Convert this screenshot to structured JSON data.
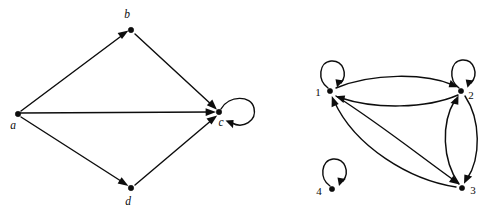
{
  "figure": {
    "background_color": "#ffffff",
    "ink_color": "#0d0d0d"
  },
  "graphs": [
    {
      "id": "left-graph",
      "name": "lettered-digraph",
      "nodes": [
        {
          "id": "a",
          "label": "a",
          "x": 18,
          "y": 114,
          "label_x": 13,
          "label_y": 129,
          "label_style": "italic"
        },
        {
          "id": "b",
          "label": "b",
          "x": 131,
          "y": 30,
          "label_x": 127,
          "label_y": 18,
          "label_style": "italic"
        },
        {
          "id": "c",
          "label": "c",
          "x": 219,
          "y": 112,
          "label_x": 221,
          "label_y": 126,
          "label_style": "italic"
        },
        {
          "id": "d",
          "label": "d",
          "x": 131,
          "y": 188,
          "label_x": 128,
          "label_y": 205,
          "label_style": "italic"
        }
      ],
      "edges": [
        {
          "from": "a",
          "to": "b",
          "kind": "straight"
        },
        {
          "from": "b",
          "to": "c",
          "kind": "straight"
        },
        {
          "from": "a",
          "to": "c",
          "kind": "straight"
        },
        {
          "from": "a",
          "to": "d",
          "kind": "straight"
        },
        {
          "from": "d",
          "to": "c",
          "kind": "straight"
        },
        {
          "from": "c",
          "to": "c",
          "kind": "self-loop",
          "loop_direction": "right"
        }
      ]
    },
    {
      "id": "right-graph",
      "name": "numbered-digraph",
      "nodes": [
        {
          "id": "1",
          "label": "1",
          "x": 330,
          "y": 91,
          "label_x": 318,
          "label_y": 96,
          "label_style": "normal"
        },
        {
          "id": "2",
          "label": "2",
          "x": 461,
          "y": 91,
          "label_x": 470,
          "label_y": 99,
          "label_style": "normal"
        },
        {
          "id": "3",
          "label": "3",
          "x": 462,
          "y": 188,
          "label_x": 472,
          "label_y": 194,
          "label_style": "normal"
        },
        {
          "id": "4",
          "label": "4",
          "x": 332,
          "y": 189,
          "label_x": 319,
          "label_y": 195,
          "label_style": "normal"
        }
      ],
      "edges": [
        {
          "from": "1",
          "to": "1",
          "kind": "self-loop",
          "loop_direction": "up"
        },
        {
          "from": "2",
          "to": "2",
          "kind": "self-loop",
          "loop_direction": "up"
        },
        {
          "from": "4",
          "to": "4",
          "kind": "self-loop",
          "loop_direction": "up"
        },
        {
          "from": "1",
          "to": "2",
          "kind": "curved",
          "bow": "above"
        },
        {
          "from": "2",
          "to": "1",
          "kind": "curved",
          "bow": "below"
        },
        {
          "from": "1",
          "to": "3",
          "kind": "curved",
          "bow": "below"
        },
        {
          "from": "3",
          "to": "1",
          "kind": "curved",
          "bow": "above"
        },
        {
          "from": "2",
          "to": "3",
          "kind": "curved",
          "bow": "right"
        },
        {
          "from": "3",
          "to": "2",
          "kind": "curved",
          "bow": "left"
        }
      ]
    }
  ]
}
